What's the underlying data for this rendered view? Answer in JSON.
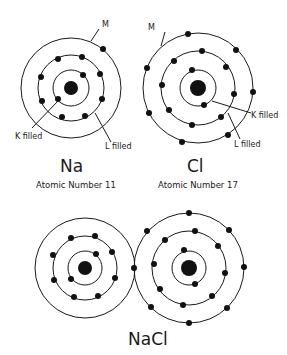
{
  "diagram": {
    "colors": {
      "stroke": "#1a1a1a",
      "electron": "#111111",
      "background": "#ffffff"
    },
    "atoms": [
      {
        "id": "na",
        "symbol": "Na",
        "atomic_number_label": "Atomic Number 11",
        "shell_labels": {
          "m": "M",
          "k": "K filled",
          "l": "L filled"
        },
        "electrons": {
          "K": 2,
          "L": 8,
          "M": 1
        }
      },
      {
        "id": "cl",
        "symbol": "Cl",
        "atomic_number_label": "Atomic Number 17",
        "shell_labels": {
          "m": "M",
          "k": "K filled",
          "l": "L filled"
        },
        "electrons": {
          "K": 2,
          "L": 8,
          "M": 7
        }
      }
    ],
    "compound": {
      "label": "NaCl",
      "shared_electrons_na": {
        "K": 2,
        "L": 8,
        "M": 0
      },
      "shared_electrons_cl": {
        "K": 2,
        "L": 8,
        "M": 8
      }
    }
  }
}
